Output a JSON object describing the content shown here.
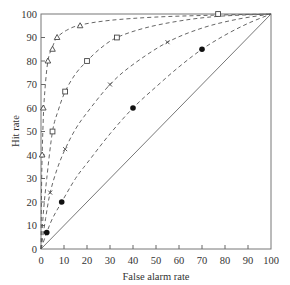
{
  "chart_data": {
    "type": "line",
    "title": "",
    "xlabel": "False alarm rate",
    "ylabel": "Hit rate",
    "xlim": [
      0,
      100
    ],
    "ylim": [
      0,
      100
    ],
    "grid": false,
    "legend": "none",
    "x_ticks": [
      0,
      10,
      20,
      30,
      40,
      50,
      60,
      70,
      80,
      90,
      100
    ],
    "y_ticks": [
      0,
      10,
      20,
      30,
      40,
      50,
      60,
      70,
      80,
      90,
      100
    ],
    "x_tick_labels": [
      "0",
      "10",
      "20",
      "30",
      "40",
      "50",
      "60",
      "70",
      "80",
      "90",
      "100"
    ],
    "y_tick_labels": [
      "0",
      "10",
      "20",
      "30",
      "40",
      "50",
      "60",
      "70",
      "80",
      "90",
      "100"
    ],
    "reference_line": {
      "name": "chance diagonal",
      "style": "solid",
      "x": [
        0,
        100
      ],
      "y": [
        0,
        100
      ]
    },
    "series": [
      {
        "name": "triangle",
        "marker": "triangle",
        "style": "dashed",
        "points": [
          [
            0.5,
            40
          ],
          [
            1,
            60
          ],
          [
            3,
            80
          ],
          [
            5,
            85
          ],
          [
            7,
            90
          ],
          [
            17,
            95
          ]
        ],
        "curve": [
          [
            0,
            0
          ],
          [
            0.3,
            30
          ],
          [
            0.8,
            50
          ],
          [
            1.5,
            65
          ],
          [
            3,
            80
          ],
          [
            5,
            86
          ],
          [
            7,
            90
          ],
          [
            11,
            93
          ],
          [
            17,
            95.3
          ],
          [
            30,
            97.3
          ],
          [
            50,
            98.7
          ],
          [
            75,
            99.5
          ],
          [
            100,
            100
          ]
        ]
      },
      {
        "name": "square",
        "marker": "square",
        "style": "dashed",
        "points": [
          [
            5,
            50
          ],
          [
            10.5,
            67
          ],
          [
            20,
            80
          ],
          [
            33,
            90
          ],
          [
            77,
            100
          ]
        ],
        "curve": [
          [
            0,
            0
          ],
          [
            1,
            15
          ],
          [
            2.5,
            30
          ],
          [
            5,
            50
          ],
          [
            7.5,
            59
          ],
          [
            10.5,
            67
          ],
          [
            15,
            74.5
          ],
          [
            20,
            80
          ],
          [
            26,
            85.5
          ],
          [
            33,
            90
          ],
          [
            45,
            94
          ],
          [
            60,
            97
          ],
          [
            77,
            99
          ],
          [
            100,
            100
          ]
        ]
      },
      {
        "name": "cross",
        "marker": "x",
        "style": "dashed",
        "points": [
          [
            4,
            24
          ],
          [
            10.5,
            42.5
          ],
          [
            30,
            70
          ],
          [
            55,
            88
          ]
        ],
        "curve": [
          [
            0,
            0
          ],
          [
            2,
            13
          ],
          [
            4,
            24
          ],
          [
            7,
            34
          ],
          [
            10.5,
            42.5
          ],
          [
            15,
            51
          ],
          [
            20,
            58
          ],
          [
            30,
            70
          ],
          [
            40,
            78.5
          ],
          [
            55,
            88
          ],
          [
            70,
            94
          ],
          [
            85,
            97.7
          ],
          [
            100,
            100
          ]
        ]
      },
      {
        "name": "filled circle",
        "marker": "dot",
        "style": "dashed",
        "points": [
          [
            2.5,
            7
          ],
          [
            9,
            20
          ],
          [
            40,
            60
          ],
          [
            70,
            85
          ]
        ],
        "curve": [
          [
            0,
            0
          ],
          [
            2.5,
            7
          ],
          [
            5,
            13
          ],
          [
            9,
            20
          ],
          [
            15,
            30
          ],
          [
            20,
            36.5
          ],
          [
            30,
            49
          ],
          [
            40,
            60
          ],
          [
            50,
            69
          ],
          [
            60,
            77.5
          ],
          [
            70,
            85
          ],
          [
            80,
            91
          ],
          [
            90,
            96
          ],
          [
            100,
            100
          ]
        ]
      }
    ]
  }
}
